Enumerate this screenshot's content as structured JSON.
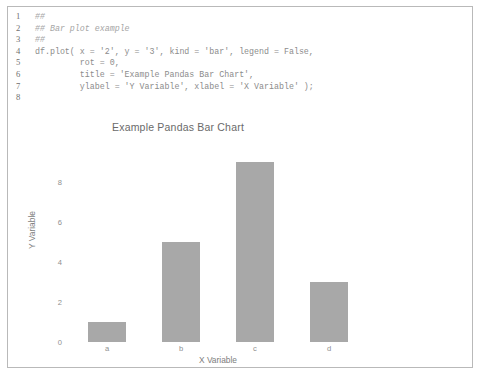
{
  "editor": {
    "lines": [
      {
        "number": "1",
        "text": "##"
      },
      {
        "number": "2",
        "text": "## Bar plot example"
      },
      {
        "number": "3",
        "text": "##"
      },
      {
        "number": "4",
        "text": "df.plot( x = '2', y = '3', kind = 'bar', legend = False,"
      },
      {
        "number": "5",
        "text": "         rot = 0,"
      },
      {
        "number": "6",
        "text": "         title = 'Example Pandas Bar Chart',"
      },
      {
        "number": "7",
        "text": "         ylabel = 'Y Variable', xlabel = 'X Variable' );"
      },
      {
        "number": "8",
        "text": ""
      }
    ]
  },
  "chart_data": {
    "type": "bar",
    "title": "Example Pandas Bar Chart",
    "xlabel": "X Variable",
    "ylabel": "Y Variable",
    "categories": [
      "a",
      "b",
      "c",
      "d"
    ],
    "values": [
      1,
      5,
      9,
      3
    ],
    "yticks": [
      0,
      2,
      4,
      6,
      8
    ],
    "ylim": [
      0,
      9.45
    ],
    "grid": false,
    "legend": false,
    "bar_color": "#a8a8a8"
  }
}
